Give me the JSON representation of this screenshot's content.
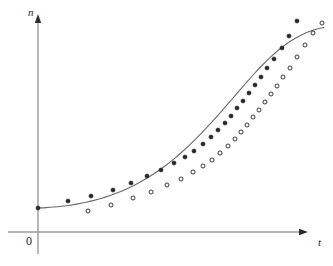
{
  "figure": {
    "background_color": "#ffffff",
    "axis_color": "#9a9a9a",
    "curve_color": "#6b6b6b",
    "marker_color": "#262626",
    "labels": {
      "y_axis": "n",
      "x_axis": "t",
      "origin": "0"
    },
    "axes_geometry": {
      "origin_x": 38,
      "origin_y": 232,
      "y_axis_top": 14,
      "x_axis_right": 308
    }
  },
  "chart_data": {
    "type": "line",
    "title": "",
    "subtitle": "",
    "xlabel": "t",
    "ylabel": "n",
    "grid": false,
    "legend": "none",
    "axis_arrows": true,
    "xlim": [
      0,
      308
    ],
    "ylim": [
      0,
      232
    ],
    "annotations": [
      "0"
    ],
    "curve": {
      "name": "fitted logistic curve",
      "style": "solid",
      "points": [
        [
          38,
          208
        ],
        [
          46,
          207.6
        ],
        [
          54,
          207.0
        ],
        [
          62,
          206.2
        ],
        [
          70,
          205.2
        ],
        [
          78,
          203.9
        ],
        [
          86,
          202.3
        ],
        [
          94,
          200.4
        ],
        [
          102,
          198.2
        ],
        [
          110,
          195.6
        ],
        [
          118,
          192.6
        ],
        [
          126,
          189.2
        ],
        [
          134,
          185.4
        ],
        [
          142,
          181.1
        ],
        [
          150,
          176.3
        ],
        [
          158,
          171.0
        ],
        [
          166,
          165.2
        ],
        [
          174,
          158.9
        ],
        [
          182,
          152.0
        ],
        [
          190,
          144.6
        ],
        [
          198,
          136.7
        ],
        [
          206,
          128.4
        ],
        [
          214,
          119.7
        ],
        [
          222,
          110.7
        ],
        [
          230,
          101.5
        ],
        [
          238,
          92.2
        ],
        [
          246,
          83.0
        ],
        [
          254,
          74.0
        ],
        [
          262,
          65.5
        ],
        [
          270,
          57.6
        ],
        [
          278,
          50.5
        ],
        [
          286,
          44.3
        ],
        [
          294,
          39.0
        ],
        [
          302,
          34.7
        ],
        [
          310,
          31.3
        ],
        [
          318,
          28.8
        ],
        [
          324,
          27.6
        ]
      ]
    },
    "series": [
      {
        "name": "observed-filled",
        "marker": "filled-circle",
        "values": [
          [
            38,
            208
          ],
          [
            68,
            201
          ],
          [
            91,
            196
          ],
          [
            113,
            190
          ],
          [
            131,
            183
          ],
          [
            147,
            176
          ],
          [
            161,
            170
          ],
          [
            174,
            163
          ],
          [
            185,
            157
          ],
          [
            194,
            151
          ],
          [
            203,
            144
          ],
          [
            211,
            137
          ],
          [
            218,
            130
          ],
          [
            225,
            123
          ],
          [
            231,
            116
          ],
          [
            237,
            108
          ],
          [
            243,
            101
          ],
          [
            249,
            93
          ],
          [
            255,
            85
          ],
          [
            261,
            77
          ],
          [
            267,
            68
          ],
          [
            274,
            59
          ],
          [
            282,
            48
          ],
          [
            289,
            36
          ],
          [
            297,
            21
          ]
        ]
      },
      {
        "name": "observed-open",
        "marker": "open-circle",
        "values": [
          [
            88,
            211
          ],
          [
            111,
            205
          ],
          [
            133,
            198
          ],
          [
            151,
            192
          ],
          [
            167,
            185
          ],
          [
            181,
            179
          ],
          [
            193,
            172
          ],
          [
            203,
            166
          ],
          [
            212,
            160
          ],
          [
            220,
            153
          ],
          [
            228,
            146
          ],
          [
            235,
            139
          ],
          [
            241,
            132
          ],
          [
            247,
            125
          ],
          [
            253,
            117
          ],
          [
            259,
            110
          ],
          [
            265,
            102
          ],
          [
            271,
            94
          ],
          [
            277,
            86
          ],
          [
            283,
            77
          ],
          [
            290,
            68
          ],
          [
            297,
            57
          ],
          [
            305,
            45
          ],
          [
            313,
            33
          ],
          [
            322,
            23
          ]
        ]
      }
    ]
  }
}
